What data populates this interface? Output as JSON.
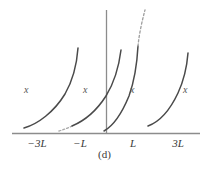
{
  "figure": {
    "caption": "(d)",
    "background_color": "#ffffff",
    "curve_color": "#4a4a4a",
    "axis_color": "#8c8c8c",
    "label_color": "#555555"
  },
  "axes": {
    "x_axis_name": "horizontal-axis",
    "y_axis_name": "vertical-axis",
    "x_tick_labels": [
      {
        "text": "−3L",
        "x": 37,
        "value": -3
      },
      {
        "text": "−L",
        "x": 80,
        "value": -1
      },
      {
        "text": "L",
        "x": 133,
        "value": 1
      },
      {
        "text": "3L",
        "x": 178,
        "value": 3
      }
    ]
  },
  "branch_labels": [
    {
      "text": "x",
      "x": 24,
      "y": 84
    },
    {
      "text": "x",
      "x": 83,
      "y": 84
    },
    {
      "text": "x",
      "x": 130,
      "y": 84
    },
    {
      "text": "x",
      "x": 183,
      "y": 84
    }
  ],
  "chart_data": {
    "type": "line",
    "title": "",
    "subtitle": "",
    "xlabel": "",
    "ylabel": "",
    "caption": "(d)",
    "grid": false,
    "legend": null,
    "xlim": [
      -4,
      4
    ],
    "ylim": [
      0,
      1
    ],
    "x_tick_values": [
      -3,
      -1,
      1,
      3
    ],
    "x_tick_text": [
      "−3L",
      "−L",
      "L",
      "3L"
    ],
    "series": [
      {
        "name": "branch-1",
        "style": "solid",
        "path": "M 24,128 C 38,124 54,112 65,94 C 73,80 77,62 78,48",
        "x_start": -3.6,
        "x_end": -2.0
      },
      {
        "name": "branch-2-dashed-tail",
        "style": "dashed",
        "path": "M 59,131 C 63,130 68,128 72,126",
        "x_start": -2.0,
        "x_end": -1.7
      },
      {
        "name": "branch-2",
        "style": "solid",
        "path": "M 72,126 C 84,121 97,110 106,96 C 114,83 119,66 121,50",
        "x_start": -1.7,
        "x_end": 0.0
      },
      {
        "name": "branch-3",
        "style": "solid",
        "path": "M 104,131 C 113,126 122,113 129,96 C 134,82 137,65 138,46",
        "x_start": 0.0,
        "x_end": 1.3
      },
      {
        "name": "branch-3-dashed-tail",
        "style": "dashed",
        "path": "M 138,46 C 139,35 142,21 145,10",
        "x_start": 1.3,
        "x_end": 1.9
      },
      {
        "name": "branch-4",
        "style": "solid",
        "path": "M 148,126 C 159,122 170,110 178,93 C 184,80 187,66 188,53",
        "x_start": 1.9,
        "x_end": 3.6
      }
    ],
    "annotations": [
      {
        "text": "x",
        "x": -3.0,
        "y": 0.38
      },
      {
        "text": "x",
        "x": -1.1,
        "y": 0.38
      },
      {
        "text": "x",
        "x": 0.9,
        "y": 0.38
      },
      {
        "text": "x",
        "x": 2.9,
        "y": 0.38
      }
    ]
  }
}
